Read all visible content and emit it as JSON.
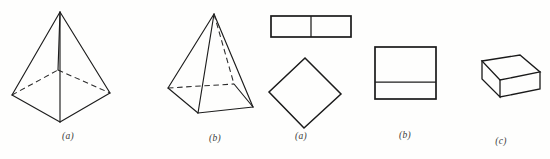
{
  "page": {
    "width": 550,
    "height": 159,
    "background_color": "#fefefd",
    "ink_color": "#1d1d1d"
  },
  "figures": [
    {
      "id": "pyramid-square-base-perspective",
      "kind": "3d-solid",
      "shape_name": "square pyramid",
      "label": "(a)",
      "view": "oblique perspective, base diamond-shaped, hidden back edges dashed",
      "visible_edges": 7,
      "hidden_edges": 2,
      "label_x": 67,
      "label_y": 131
    },
    {
      "id": "pyramid-square-base-tilted",
      "kind": "3d-solid",
      "shape_name": "square pyramid",
      "label": "(b)",
      "view": "oblique view from higher angle, base parallelogram, hidden back edges and axis dashed",
      "visible_edges": 7,
      "hidden_edges": 3,
      "label_x": 213,
      "label_y": 133
    },
    {
      "id": "rectangle-divided-vertically",
      "kind": "plane-figure",
      "shape_name": "rectangle with vertical median",
      "label": "",
      "view": "front elevation, two equal cells",
      "cells": 2,
      "label_x": null,
      "label_y": null
    },
    {
      "id": "square-rotated-diamond",
      "kind": "plane-figure",
      "shape_name": "square rotated 45 degrees (diamond)",
      "label": "(a)",
      "view": "plan view",
      "label_x": 300,
      "label_y": 131
    },
    {
      "id": "square-divided-horizontally",
      "kind": "plane-figure",
      "shape_name": "rectangle with horizontal division near base",
      "label": "(b)",
      "view": "front elevation, two unequal cells",
      "cells": 2,
      "label_x": 404,
      "label_y": 136
    },
    {
      "id": "rectangular-slab-isometric",
      "kind": "3d-solid",
      "shape_name": "rectangular slab / cuboid",
      "label": "(c)",
      "view": "isometric, top and two side faces visible",
      "label_x": 501,
      "label_y": 136
    }
  ],
  "labels": {
    "a1": "(a)",
    "b1": "(b)",
    "a2": "(a)",
    "b2": "(b)",
    "c1": "(c)"
  }
}
